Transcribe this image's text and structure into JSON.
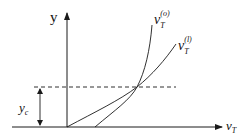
{
  "diagram": {
    "y_axis_label": "y",
    "x_axis_label_main": "v",
    "x_axis_label_sub": "T",
    "threshold_label_main": "y",
    "threshold_label_sub": "c",
    "curves": [
      {
        "name": "v_T^(o)",
        "main": "v",
        "sub": "T",
        "sup": "(o)"
      },
      {
        "name": "v_T^(l)",
        "main": "v",
        "sub": "T",
        "sup": "(l)"
      }
    ],
    "colors": {
      "line": "#1a1a1a",
      "background": "#ffffff"
    }
  }
}
